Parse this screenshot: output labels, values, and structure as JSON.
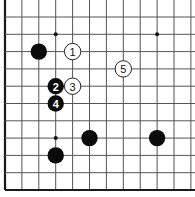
{
  "diagram": {
    "type": "go-board-fragment",
    "board_size": 19,
    "visible_region": {
      "columns": [
        "A",
        "B",
        "C",
        "D",
        "E",
        "F",
        "G",
        "H",
        "J",
        "K",
        "L",
        "M"
      ],
      "rows_from_bottom": [
        1,
        2,
        3,
        4,
        5,
        6,
        7,
        8,
        9,
        10,
        11
      ],
      "edges_shown": [
        "left",
        "bottom"
      ]
    },
    "colors": {
      "background": "#ffffff",
      "grid": "#555555",
      "edge": "#1a1a1a",
      "black_stone": "#0b0b0b",
      "white_stone": "#ffffff"
    },
    "star_points": [
      {
        "col": "D",
        "row": 4
      },
      {
        "col": "D",
        "row": 10
      },
      {
        "col": "K",
        "row": 10
      }
    ],
    "stones": [
      {
        "color": "black",
        "col": "C",
        "row": 9,
        "label": ""
      },
      {
        "color": "black",
        "col": "F",
        "row": 4,
        "label": ""
      },
      {
        "color": "black",
        "col": "D",
        "row": 3,
        "label": ""
      },
      {
        "color": "black",
        "col": "K",
        "row": 4,
        "label": ""
      },
      {
        "color": "white",
        "col": "E",
        "row": 9,
        "label": "1"
      },
      {
        "color": "black",
        "col": "D",
        "row": 7,
        "label": "2"
      },
      {
        "color": "white",
        "col": "E",
        "row": 7,
        "label": "3"
      },
      {
        "color": "black",
        "col": "D",
        "row": 6,
        "label": "4"
      },
      {
        "color": "white",
        "col": "H",
        "row": 8,
        "label": "5"
      }
    ]
  }
}
